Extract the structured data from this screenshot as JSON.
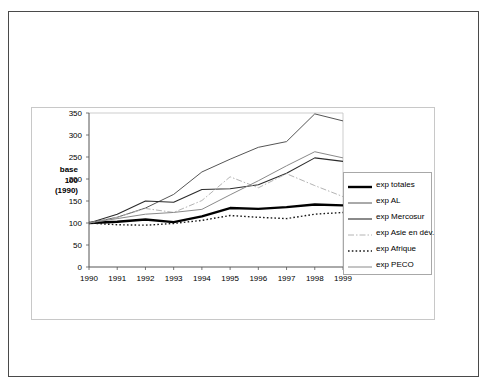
{
  "chart_data": {
    "type": "line",
    "title": "",
    "subtitle": "",
    "xlabel": "",
    "ylabel": "base 100 (1990)",
    "ylabel_lines": [
      "base",
      "100",
      "(1990)"
    ],
    "x": [
      1990,
      1991,
      1992,
      1993,
      1994,
      1995,
      1996,
      1997,
      1998,
      1999
    ],
    "categories": [
      "1990",
      "1991",
      "1992",
      "1993",
      "1994",
      "1995",
      "1996",
      "1997",
      "1998",
      "1999"
    ],
    "xlim": [
      1990,
      1999
    ],
    "ylim": [
      0,
      350
    ],
    "yticks": [
      0,
      50,
      100,
      150,
      200,
      250,
      300,
      350
    ],
    "ytick_labels": [
      "0",
      "50",
      "100",
      "150",
      "200",
      "250",
      "300",
      "350"
    ],
    "grid": false,
    "legend_position": "right",
    "series": [
      {
        "name": "exp totales",
        "style": "solid-thick",
        "color": "#000000",
        "width": 2.4,
        "dash": "none",
        "values": [
          100,
          103,
          108,
          102,
          115,
          134,
          132,
          136,
          142,
          140
        ]
      },
      {
        "name": "exp AL",
        "style": "solid-thin",
        "color": "#555555",
        "width": 1,
        "dash": "none",
        "values": [
          100,
          113,
          134,
          165,
          216,
          245,
          272,
          285,
          348,
          332
        ]
      },
      {
        "name": "exp Mercosur",
        "style": "solid-thin",
        "color": "#2b2b2b",
        "width": 1.1,
        "dash": "none",
        "values": [
          100,
          120,
          150,
          147,
          176,
          178,
          187,
          213,
          248,
          240
        ]
      },
      {
        "name": "exp Asie en dév.",
        "style": "dash-dot",
        "color": "#b4b4b4",
        "width": 1,
        "dash": "6 2 1.5 2",
        "values": [
          100,
          113,
          133,
          124,
          151,
          205,
          180,
          212,
          185,
          160
        ]
      },
      {
        "name": "exp Afrique",
        "style": "dotted",
        "color": "#1a1a1a",
        "width": 1.4,
        "dash": "1.6 2.2",
        "values": [
          100,
          96,
          95,
          99,
          106,
          117,
          113,
          110,
          120,
          124
        ]
      },
      {
        "name": "exp PECO",
        "style": "solid-thin",
        "color": "#8a8a8a",
        "width": 1,
        "dash": "none",
        "values": [
          100,
          110,
          120,
          124,
          131,
          164,
          196,
          230,
          262,
          248
        ]
      }
    ]
  },
  "legend": {
    "entries": [
      {
        "label": "exp totales"
      },
      {
        "label": "exp AL"
      },
      {
        "label": "exp Mercosur"
      },
      {
        "label": "exp Asie en dév."
      },
      {
        "label": "exp Afrique"
      },
      {
        "label": "exp PECO"
      }
    ]
  }
}
